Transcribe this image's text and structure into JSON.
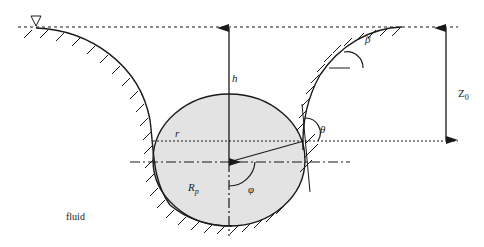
{
  "diagram": {
    "labels": {
      "h": "h",
      "beta": "β",
      "z0_main": "Z",
      "z0_sub": "0",
      "theta": "θ",
      "r": "r",
      "rp_main": "R",
      "rp_sub": "p",
      "phi": "φ",
      "fluid": "fluid"
    },
    "colors": {
      "particle_fill": "#e3e3e3",
      "line": "#1a1a1a",
      "background": "#ffffff"
    }
  }
}
